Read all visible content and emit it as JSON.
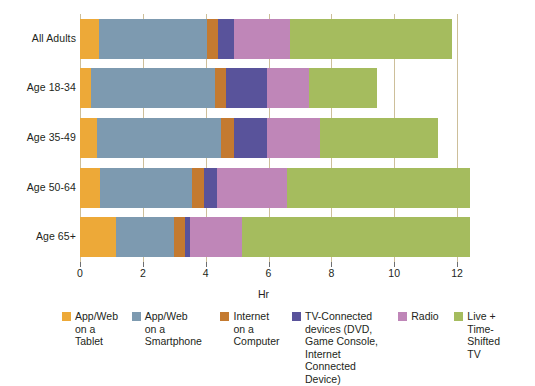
{
  "chart_data": {
    "type": "bar",
    "orientation": "horizontal",
    "stacked": true,
    "title": "",
    "xlabel": "Hr",
    "ylabel": "",
    "xlim": [
      0,
      12
    ],
    "xticks": [
      0,
      2,
      4,
      6,
      8,
      10,
      12
    ],
    "xtick_labels": [
      "0",
      "2",
      "4",
      "6",
      "8",
      "10",
      "12"
    ],
    "grid": "vertical",
    "legend_position": "bottom",
    "categories": [
      "All Adults",
      "Age 18-34",
      "Age 35-49",
      "Age 50-64",
      "Age 65+"
    ],
    "series": [
      {
        "name": "App/Web on a Tablet",
        "legend_label": "App/Web\non a\nTablet",
        "color": "#eda938",
        "values": [
          0.6,
          0.35,
          0.55,
          0.65,
          1.15
        ]
      },
      {
        "name": "App/Web on a Smartphone",
        "legend_label": "App/Web\non a\nSmartphone",
        "color": "#7d9ab0",
        "values": [
          3.45,
          3.95,
          3.95,
          2.9,
          1.85
        ]
      },
      {
        "name": "Internet on a Computer",
        "legend_label": "Internet\non a\nComputer",
        "color": "#c47a30",
        "values": [
          0.35,
          0.35,
          0.4,
          0.4,
          0.35
        ]
      },
      {
        "name": "TV-Connected devices (DVD, Game Console, Internet Connected Device)",
        "legend_label": "TV-Connected\ndevices (DVD,\nGame Console,\nInternet\nConnected Device)",
        "color": "#59539b",
        "values": [
          0.5,
          1.3,
          1.05,
          0.4,
          0.15
        ]
      },
      {
        "name": "Radio",
        "legend_label": "Radio",
        "color": "#bf86b8",
        "values": [
          1.8,
          1.35,
          1.7,
          2.25,
          1.65
        ]
      },
      {
        "name": "Live + Time-Shifted TV",
        "legend_label": "Live +\nTime-\nShifted TV",
        "color": "#a5bc5e",
        "values": [
          5.15,
          2.15,
          3.75,
          5.8,
          7.25
        ]
      }
    ],
    "totals": [
      11.85,
      9.45,
      11.4,
      12.4,
      12.4
    ],
    "axis_color": "#cdbf9a",
    "tick_color": "#6d6e71",
    "text_color": "#231f20",
    "background": "#ffffff"
  }
}
